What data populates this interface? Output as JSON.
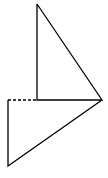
{
  "diagram": {
    "stroke_color": "#000000",
    "background": "#ffffff",
    "upper_triangle": {
      "points": [
        [
          37,
          4
        ],
        [
          37,
          100
        ],
        [
          102,
          100
        ]
      ]
    },
    "lower_triangle": {
      "points": [
        [
          8,
          100
        ],
        [
          8,
          166
        ],
        [
          102,
          100
        ]
      ]
    },
    "dashed_segment": {
      "from": [
        8,
        100
      ],
      "to": [
        37,
        100
      ]
    }
  }
}
